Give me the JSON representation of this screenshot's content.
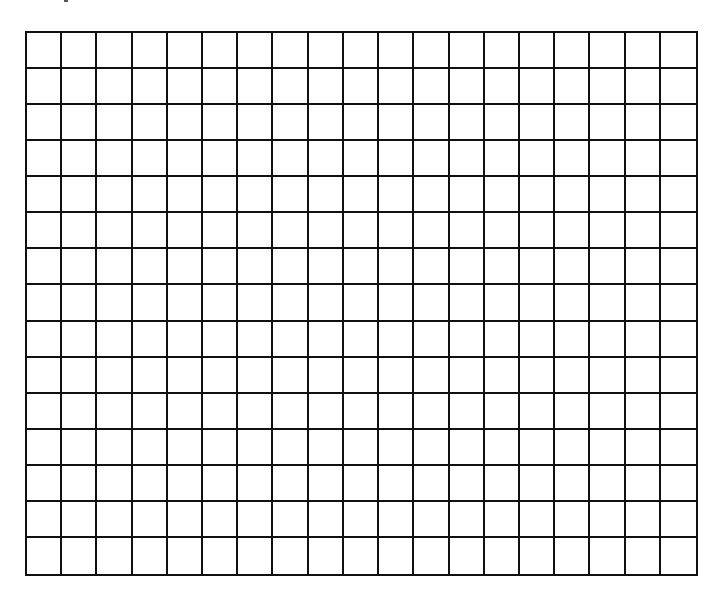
{
  "worksheet": {
    "type": "blank-grid",
    "rows": 15,
    "columns": 19,
    "line_color": "#111111",
    "background_color": "#ffffff"
  }
}
